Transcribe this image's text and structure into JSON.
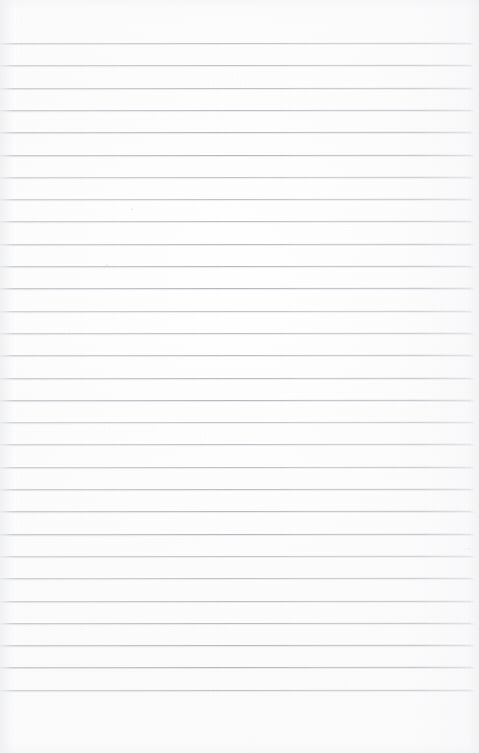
{
  "document": {
    "kind": "scanned-lined-paper",
    "description": "Blank ruled notebook page, scanned",
    "width_px": 479,
    "height_px": 753,
    "page_background_color": "#fdfdfd",
    "rule_color": "#babec3",
    "rule_thickness_px": 1,
    "rule_count": 30,
    "first_rule_y_px": 43,
    "last_rule_y_px": 701,
    "rule_spacing_px": 22.3,
    "rule_left_x_px": 0,
    "rule_right_x_px": 474,
    "top_margin_px": 43,
    "bottom_margin_px": 52,
    "scan_skew_deg": -0.07,
    "written_content": "",
    "has_text": false,
    "has_margin_rule": false,
    "has_holes": false
  },
  "rules": [
    {
      "y": 43.0
    },
    {
      "y": 65.3
    },
    {
      "y": 87.6
    },
    {
      "y": 109.9
    },
    {
      "y": 132.2
    },
    {
      "y": 154.5
    },
    {
      "y": 176.8
    },
    {
      "y": 199.1
    },
    {
      "y": 221.4
    },
    {
      "y": 243.7
    },
    {
      "y": 266.0
    },
    {
      "y": 288.3
    },
    {
      "y": 310.6
    },
    {
      "y": 332.9
    },
    {
      "y": 355.2
    },
    {
      "y": 377.5
    },
    {
      "y": 399.8
    },
    {
      "y": 422.1
    },
    {
      "y": 444.4
    },
    {
      "y": 466.7
    },
    {
      "y": 489.0
    },
    {
      "y": 511.3
    },
    {
      "y": 533.6
    },
    {
      "y": 555.9
    },
    {
      "y": 578.2
    },
    {
      "y": 600.5
    },
    {
      "y": 622.8
    },
    {
      "y": 645.1
    },
    {
      "y": 667.4
    },
    {
      "y": 689.7
    }
  ],
  "specks": [
    {
      "x": 103,
      "y": 72,
      "size": 1.4,
      "opacity": 0.3
    },
    {
      "x": 236,
      "y": 76,
      "size": 1.2,
      "opacity": 0.22
    },
    {
      "x": 131,
      "y": 208,
      "size": 1.8,
      "opacity": 0.42
    },
    {
      "x": 106,
      "y": 264,
      "size": 1.6,
      "opacity": 0.38
    },
    {
      "x": 104,
      "y": 268,
      "size": 1.3,
      "opacity": 0.3
    },
    {
      "x": 311,
      "y": 215,
      "size": 1.1,
      "opacity": 0.24
    },
    {
      "x": 399,
      "y": 393,
      "size": 1.2,
      "opacity": 0.22
    },
    {
      "x": 205,
      "y": 437,
      "size": 1.0,
      "opacity": 0.2
    },
    {
      "x": 468,
      "y": 548,
      "size": 1.5,
      "opacity": 0.3
    },
    {
      "x": 62,
      "y": 626,
      "size": 1.1,
      "opacity": 0.22
    },
    {
      "x": 346,
      "y": 684,
      "size": 1.2,
      "opacity": 0.26
    },
    {
      "x": 248,
      "y": 741,
      "size": 1.0,
      "opacity": 0.18
    }
  ]
}
